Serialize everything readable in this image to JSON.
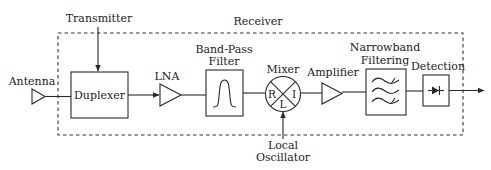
{
  "diagram": {
    "type": "block-diagram",
    "title": "Receiver",
    "labels": {
      "transmitter": "Transmitter",
      "receiver": "Receiver",
      "antenna": "Antenna",
      "duplexer": "Duplexer",
      "lna": "LNA",
      "bpf_line1": "Band-Pass",
      "bpf_line2": "Filter",
      "mixer": "Mixer",
      "mixer_r": "R",
      "mixer_i": "I",
      "mixer_l": "L",
      "amplifier": "Amplifier",
      "nb_line1": "Narrowband",
      "nb_line2": "Filtering",
      "detection": "Detection",
      "lo_line1": "Local",
      "lo_line2": "Oscillator"
    },
    "nodes": [
      {
        "id": "antenna",
        "shape": "triangle",
        "icon": "antenna-icon"
      },
      {
        "id": "duplexer",
        "shape": "box"
      },
      {
        "id": "lna",
        "shape": "triangle",
        "icon": "amplifier-icon"
      },
      {
        "id": "bpf",
        "shape": "box",
        "icon": "bandpass-curve-icon"
      },
      {
        "id": "mixer",
        "shape": "circle-x",
        "icon": "mixer-icon"
      },
      {
        "id": "amplifier",
        "shape": "triangle",
        "icon": "amplifier-icon"
      },
      {
        "id": "narrowband",
        "shape": "box",
        "icon": "filter-waves-icon"
      },
      {
        "id": "detection",
        "shape": "box",
        "icon": "diode-icon"
      }
    ],
    "edges": [
      [
        "transmitter",
        "duplexer"
      ],
      [
        "antenna",
        "duplexer"
      ],
      [
        "duplexer",
        "lna"
      ],
      [
        "lna",
        "bpf"
      ],
      [
        "bpf",
        "mixer"
      ],
      [
        "local_oscillator",
        "mixer"
      ],
      [
        "mixer",
        "amplifier"
      ],
      [
        "amplifier",
        "narrowband"
      ],
      [
        "narrowband",
        "detection"
      ],
      [
        "detection",
        "output"
      ]
    ],
    "colors": {
      "stroke": "#2a2a2a",
      "text": "#222222",
      "background": "#ffffff"
    }
  }
}
